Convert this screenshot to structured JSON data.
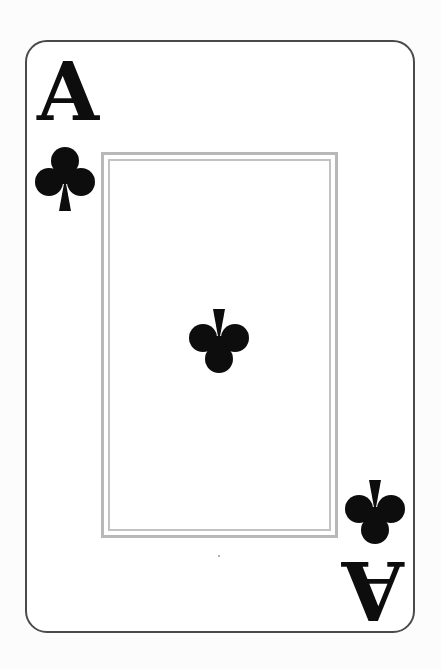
{
  "card": {
    "rank": "A",
    "suit": "clubs",
    "suit_glyph": "♣",
    "corner_rank_top_left": "A",
    "corner_rank_bottom_right": "A",
    "colors": {
      "ink": "#0d0d0d",
      "card_border": "#4a4a4a",
      "frame": "#b8b8b8",
      "face": "#ffffff",
      "background": "#fcfcfc"
    }
  }
}
